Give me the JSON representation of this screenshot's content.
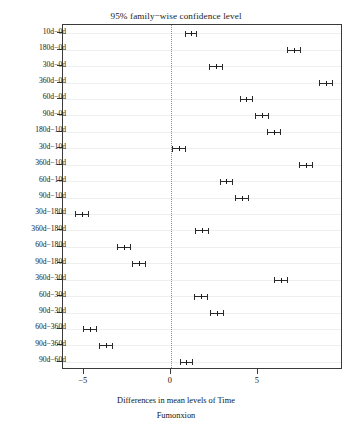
{
  "chart_data": {
    "type": "scatter",
    "title": "95% family−wise confidence level",
    "xlabel": "Differences in mean levels of Time",
    "caption": "Fumonxion",
    "ylabel": "",
    "xlim": [
      -6.2,
      9.9
    ],
    "xticks": [
      -5,
      0,
      5
    ],
    "xtick_labels": [
      "−5",
      "0",
      "5"
    ],
    "grid": true,
    "reference_line": 0,
    "orientation": "horizontal",
    "categories": [
      "10d−0d",
      "180d−0d",
      "30d−0d",
      "360d−0d",
      "60d−0d",
      "90d−0d",
      "180d−10d",
      "30d−10d",
      "360d−10d",
      "60d−10d",
      "90d−10d",
      "30d−180d",
      "360d−180d",
      "60d−180d",
      "90d−180d",
      "360d−30d",
      "60d−30d",
      "90d−30d",
      "60d−360d",
      "90d−360d",
      "90d−60d"
    ],
    "points": [
      {
        "category": "10d−0d",
        "estimate": 1.15,
        "lower": 0.8,
        "upper": 1.5
      },
      {
        "category": "180d−0d",
        "estimate": 7.1,
        "lower": 6.7,
        "upper": 7.5
      },
      {
        "category": "30d−0d",
        "estimate": 2.6,
        "lower": 2.2,
        "upper": 3.0
      },
      {
        "category": "360d−0d",
        "estimate": 8.9,
        "lower": 8.5,
        "upper": 9.3
      },
      {
        "category": "60d−0d",
        "estimate": 4.35,
        "lower": 3.95,
        "upper": 4.75
      },
      {
        "category": "90d−0d",
        "estimate": 5.25,
        "lower": 4.85,
        "upper": 5.65
      },
      {
        "category": "180d−10d",
        "estimate": 5.95,
        "lower": 5.55,
        "upper": 6.35
      },
      {
        "category": "30d−10d",
        "estimate": 0.45,
        "lower": 0.05,
        "upper": 0.85
      },
      {
        "category": "360d−10d",
        "estimate": 7.75,
        "lower": 7.35,
        "upper": 8.15
      },
      {
        "category": "60d−10d",
        "estimate": 3.2,
        "lower": 2.8,
        "upper": 3.6
      },
      {
        "category": "90d−10d",
        "estimate": 4.1,
        "lower": 3.7,
        "upper": 4.5
      },
      {
        "category": "30d−180d",
        "estimate": -5.1,
        "lower": -5.5,
        "upper": -4.7
      },
      {
        "category": "360d−180d",
        "estimate": 1.8,
        "lower": 1.4,
        "upper": 2.2
      },
      {
        "category": "60d−180d",
        "estimate": -2.7,
        "lower": -3.1,
        "upper": -2.3
      },
      {
        "category": "90d−180d",
        "estimate": -1.85,
        "lower": -2.25,
        "upper": -1.45
      },
      {
        "category": "360d−30d",
        "estimate": 6.35,
        "lower": 5.95,
        "upper": 6.75
      },
      {
        "category": "60d−30d",
        "estimate": 1.75,
        "lower": 1.35,
        "upper": 2.15
      },
      {
        "category": "90d−30d",
        "estimate": 2.65,
        "lower": 2.25,
        "upper": 3.05
      },
      {
        "category": "60d−360d",
        "estimate": -4.65,
        "lower": -5.05,
        "upper": -4.25
      },
      {
        "category": "90d−360d",
        "estimate": -3.75,
        "lower": -4.15,
        "upper": -3.35
      },
      {
        "category": "90d−60d",
        "estimate": 0.9,
        "lower": 0.5,
        "upper": 1.3
      }
    ],
    "colors": {
      "interval": "#2a2a2a",
      "grid": "#efefef",
      "frame": "#3a3a3a",
      "reference": "#8d8d8d",
      "background": "#ffffff"
    }
  }
}
